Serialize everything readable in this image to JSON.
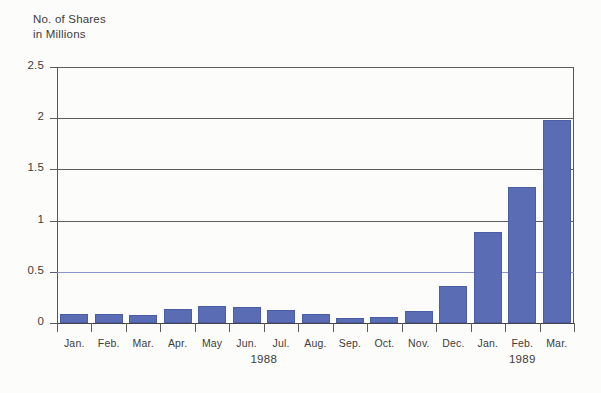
{
  "chart_data": {
    "type": "bar",
    "title_line1": "No. of Shares",
    "title_line2": "in Millions",
    "xlabel": "",
    "ylabel": "No. of Shares in Millions",
    "categories": [
      "Jan.",
      "Feb.",
      "Mar.",
      "Apr.",
      "May",
      "Jun.",
      "Jul.",
      "Aug.",
      "Sep.",
      "Oct.",
      "Nov.",
      "Dec.",
      "Jan.",
      "Feb.",
      "Mar."
    ],
    "values": [
      0.09,
      0.09,
      0.08,
      0.14,
      0.17,
      0.16,
      0.13,
      0.09,
      0.05,
      0.06,
      0.12,
      0.36,
      0.89,
      1.33,
      1.98
    ],
    "ylim": [
      0,
      2.5
    ],
    "yticks": [
      0,
      0.5,
      1,
      1.5,
      2,
      2.5
    ],
    "ytick_labels": [
      "0",
      "0.5",
      "1",
      "1.5",
      "2",
      "2.5"
    ],
    "grid": true,
    "legend": null,
    "bar_color": "#5a6cb4",
    "background_color": "#fcfcfa",
    "axis_color": "#55555a",
    "group_labels": [
      {
        "label": "1988",
        "start_index": 0,
        "end_index": 11
      },
      {
        "label": "1989",
        "start_index": 12,
        "end_index": 14
      }
    ]
  }
}
